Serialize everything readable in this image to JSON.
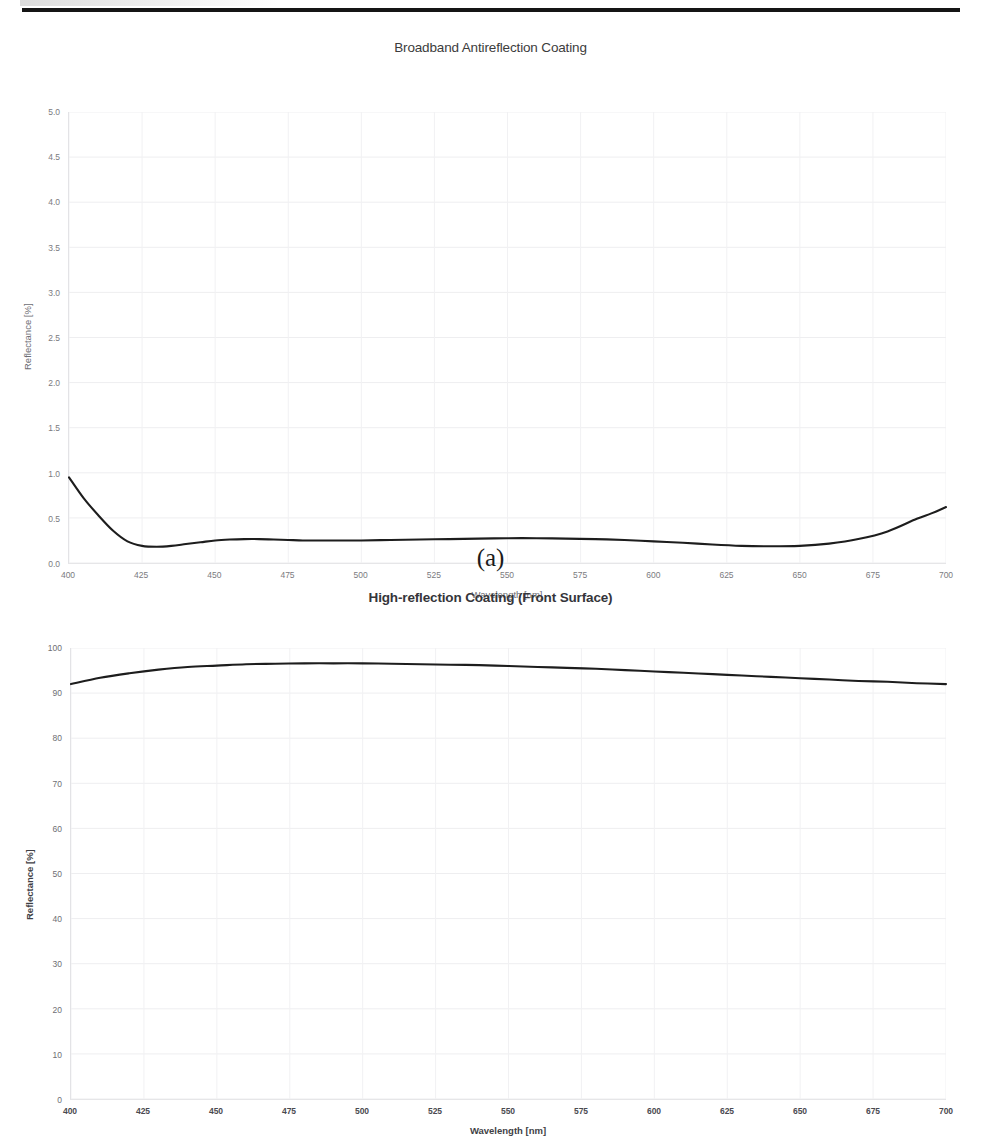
{
  "page": {
    "divider": "horizontal-rule"
  },
  "figures": [
    {
      "id": "a",
      "caption": "(a)",
      "title": "Broadband Antireflection Coating"
    },
    {
      "id": "b",
      "caption": "(b)",
      "title": "High-reflection Coating (Front Surface)"
    }
  ],
  "chart_data": [
    {
      "type": "line",
      "title": "Broadband Antireflection Coating",
      "xlabel": "Wavelength [nm]",
      "ylabel": "Reflectance [%]",
      "xlim": [
        400,
        700
      ],
      "ylim": [
        0.0,
        5.0
      ],
      "xticks": [
        400,
        425,
        450,
        475,
        500,
        525,
        550,
        575,
        600,
        625,
        650,
        675,
        700
      ],
      "xtick_labels": [
        "400",
        "425",
        "450",
        "475",
        "500",
        "525",
        "550",
        "575",
        "600",
        "625",
        "650",
        "675",
        "700"
      ],
      "yticks": [
        0.0,
        0.5,
        1.0,
        1.5,
        2.0,
        2.5,
        3.0,
        3.5,
        4.0,
        4.5,
        5.0
      ],
      "ytick_labels": [
        "0.0",
        "0.5",
        "1.0",
        "1.5",
        "2.0",
        "2.5",
        "3.0",
        "3.5",
        "4.0",
        "4.5",
        "5.0"
      ],
      "grid": true,
      "legend": "none",
      "line_color": "#1d1d1d",
      "series": [
        {
          "name": "Reflectance",
          "x": [
            400,
            405,
            410,
            415,
            420,
            425,
            430,
            435,
            440,
            445,
            450,
            455,
            460,
            465,
            470,
            475,
            480,
            485,
            490,
            495,
            500,
            510,
            520,
            530,
            540,
            550,
            560,
            570,
            580,
            590,
            600,
            610,
            620,
            630,
            640,
            650,
            660,
            670,
            680,
            690,
            695,
            700
          ],
          "y": [
            0.95,
            0.72,
            0.53,
            0.36,
            0.24,
            0.19,
            0.18,
            0.19,
            0.21,
            0.23,
            0.25,
            0.26,
            0.265,
            0.265,
            0.26,
            0.255,
            0.25,
            0.25,
            0.25,
            0.25,
            0.25,
            0.255,
            0.26,
            0.265,
            0.27,
            0.275,
            0.275,
            0.27,
            0.265,
            0.255,
            0.24,
            0.225,
            0.205,
            0.19,
            0.185,
            0.19,
            0.215,
            0.265,
            0.35,
            0.49,
            0.55,
            0.62
          ]
        }
      ]
    },
    {
      "type": "line",
      "title": "High-reflection Coating (Front Surface)",
      "xlabel": "Wavelength [nm]",
      "ylabel": "Reflectance [%]",
      "xlim": [
        400,
        700
      ],
      "ylim": [
        0,
        100
      ],
      "xticks": [
        400,
        425,
        450,
        475,
        500,
        525,
        550,
        575,
        600,
        625,
        650,
        675,
        700
      ],
      "xtick_labels": [
        "400",
        "425",
        "450",
        "475",
        "500",
        "525",
        "550",
        "575",
        "600",
        "625",
        "650",
        "675",
        "700"
      ],
      "yticks": [
        0,
        10,
        20,
        30,
        40,
        50,
        60,
        70,
        80,
        90,
        100
      ],
      "ytick_labels": [
        "0",
        "10",
        "20",
        "30",
        "40",
        "50",
        "60",
        "70",
        "80",
        "90",
        "100"
      ],
      "grid": true,
      "legend": "none",
      "line_color": "#1d1d1d",
      "series": [
        {
          "name": "Reflectance",
          "x": [
            400,
            410,
            420,
            430,
            440,
            450,
            460,
            470,
            480,
            490,
            500,
            510,
            520,
            530,
            540,
            550,
            560,
            570,
            580,
            590,
            600,
            610,
            620,
            630,
            640,
            650,
            660,
            670,
            680,
            690,
            700
          ],
          "y": [
            92.0,
            93.4,
            94.4,
            95.2,
            95.8,
            96.1,
            96.4,
            96.5,
            96.6,
            96.6,
            96.6,
            96.5,
            96.4,
            96.3,
            96.2,
            96.0,
            95.8,
            95.6,
            95.4,
            95.1,
            94.8,
            94.5,
            94.2,
            93.9,
            93.6,
            93.3,
            93.0,
            92.7,
            92.5,
            92.2,
            92.0
          ]
        }
      ]
    }
  ]
}
